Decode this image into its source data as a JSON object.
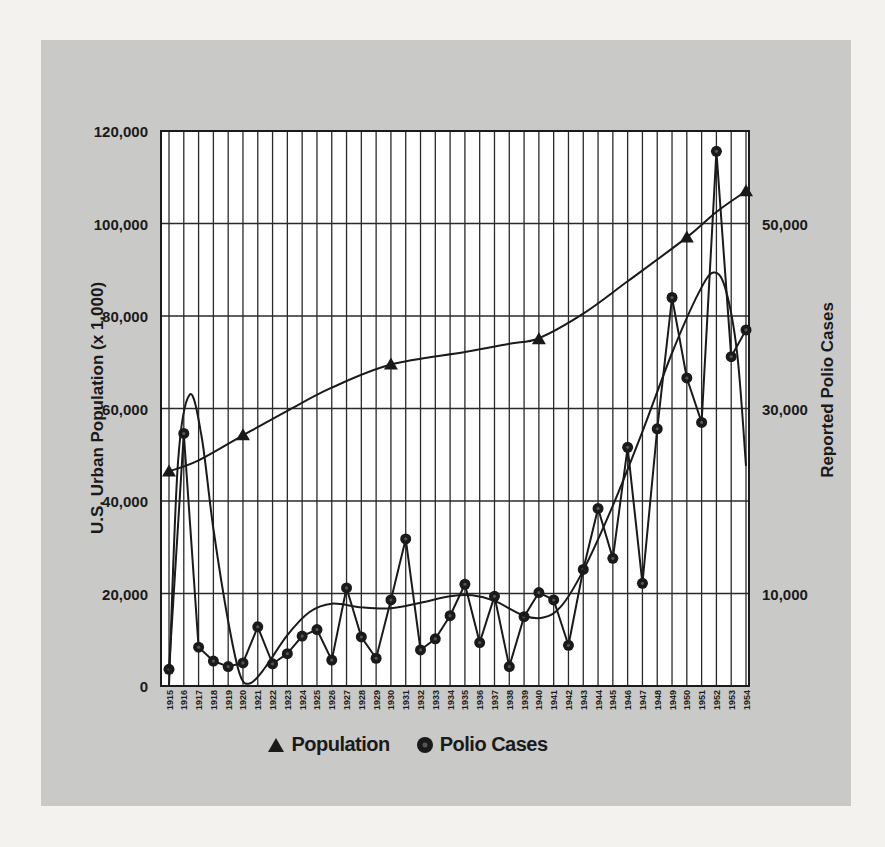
{
  "chart_data": {
    "type": "line",
    "title": "",
    "x": [
      1915,
      1916,
      1917,
      1918,
      1919,
      1920,
      1921,
      1922,
      1923,
      1924,
      1925,
      1926,
      1927,
      1928,
      1929,
      1930,
      1931,
      1932,
      1933,
      1934,
      1935,
      1936,
      1937,
      1938,
      1939,
      1940,
      1941,
      1942,
      1943,
      1944,
      1945,
      1946,
      1947,
      1948,
      1949,
      1950,
      1951,
      1952,
      1953,
      1954
    ],
    "xlabel": "",
    "x_tick_labels": [
      "1915",
      "1916",
      "1917",
      "1918",
      "1919",
      "1920",
      "1921",
      "1922",
      "1923",
      "1924",
      "1925",
      "1926",
      "1927",
      "1928",
      "1929",
      "1930",
      "1931",
      "1932",
      "1933",
      "1934",
      "1935",
      "1936",
      "1937",
      "1938",
      "1939",
      "1940",
      "1941",
      "1942",
      "1943",
      "1944",
      "1945",
      "1946",
      "1947",
      "1948",
      "1949",
      "1950",
      "1951",
      "1952",
      "1953",
      "1954"
    ],
    "ylabel_left": "U.S. Urban Population (x 1,000)",
    "ylabel_right": "Reported Polio Cases",
    "ylim_left": [
      0,
      120000
    ],
    "ylim_right": [
      0,
      60000
    ],
    "left_ticks": [
      "0",
      "20,000",
      "40,000",
      "60,000",
      "80,000",
      "100,000",
      "120,000"
    ],
    "left_tick_values": [
      0,
      20000,
      40000,
      60000,
      80000,
      100000,
      120000
    ],
    "right_ticks": [
      "10,000",
      "30,000",
      "50,000"
    ],
    "right_tick_values": [
      10000,
      30000,
      50000
    ],
    "grid": true,
    "legend_position": "bottom",
    "series": [
      {
        "name": "Population",
        "axis": "left",
        "marker": "triangle",
        "points": [
          {
            "x": 1915,
            "y": 46400
          },
          {
            "x": 1920,
            "y": 54200
          },
          {
            "x": 1930,
            "y": 69500
          },
          {
            "x": 1940,
            "y": 75000
          },
          {
            "x": 1950,
            "y": 97000
          },
          {
            "x": 1954,
            "y": 107000
          }
        ],
        "curve": [
          [
            1915,
            46400
          ],
          [
            1917,
            48800
          ],
          [
            1920,
            54200
          ],
          [
            1923,
            59500
          ],
          [
            1926,
            64500
          ],
          [
            1930,
            69500
          ],
          [
            1935,
            72200
          ],
          [
            1938,
            74000
          ],
          [
            1940,
            75200
          ],
          [
            1943,
            80500
          ],
          [
            1946,
            87500
          ],
          [
            1950,
            97000
          ],
          [
            1952,
            102500
          ],
          [
            1954,
            107000
          ]
        ]
      },
      {
        "name": "Polio Cases",
        "axis": "right",
        "marker": "circle",
        "values": [
          1800,
          27300,
          4200,
          2700,
          2100,
          2500,
          6400,
          2400,
          3500,
          5400,
          6100,
          2800,
          10600,
          5300,
          3000,
          9300,
          15900,
          3900,
          5100,
          7600,
          11000,
          4700,
          9700,
          2100,
          7500,
          10100,
          9300,
          4400,
          12600,
          19200,
          13800,
          25800,
          11100,
          27800,
          42000,
          33300,
          28500,
          57800,
          35600,
          38500
        ]
      },
      {
        "name": "Polio trend (smoothed)",
        "axis": "right",
        "marker": "none",
        "curve": [
          [
            1915,
            0
          ],
          [
            1915.6,
            24000
          ],
          [
            1916.4,
            31500
          ],
          [
            1917.2,
            27000
          ],
          [
            1918,
            17000
          ],
          [
            1919,
            7000
          ],
          [
            1919.8,
            1200
          ],
          [
            1920.5,
            300
          ],
          [
            1921.5,
            2000
          ],
          [
            1923,
            5500
          ],
          [
            1924.5,
            8000
          ],
          [
            1926,
            8900
          ],
          [
            1928,
            8500
          ],
          [
            1930,
            8400
          ],
          [
            1932,
            9000
          ],
          [
            1934,
            9700
          ],
          [
            1935.5,
            9800
          ],
          [
            1937,
            9200
          ],
          [
            1939,
            7600
          ],
          [
            1940.3,
            7400
          ],
          [
            1941.5,
            8600
          ],
          [
            1943,
            12500
          ],
          [
            1945,
            19500
          ],
          [
            1947,
            27500
          ],
          [
            1949,
            36000
          ],
          [
            1950.8,
            42500
          ],
          [
            1951.8,
            44700
          ],
          [
            1952.6,
            43000
          ],
          [
            1953.4,
            36000
          ],
          [
            1954,
            23800
          ]
        ]
      }
    ]
  },
  "legend": {
    "items": [
      {
        "label": "Population",
        "icon": "triangle-marker-icon"
      },
      {
        "label": "Polio Cases",
        "icon": "circle-marker-icon"
      }
    ]
  },
  "colors": {
    "panel_bg": "#c9c9c7",
    "plot_bg": "#ffffff",
    "ink": "#1a1a1a"
  }
}
